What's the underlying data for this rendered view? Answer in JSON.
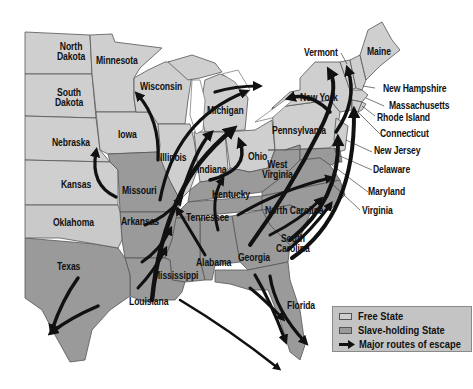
{
  "colors": {
    "free_state": "#cfcfcf",
    "slave_state": "#9a9a9a",
    "border": "#555555",
    "route": "#111111",
    "water": "#ffffff",
    "legend_bg": "#c4c4c4"
  },
  "states": {
    "north_dakota": "North\nDakota",
    "minnesota": "Minnesota",
    "south_dakota": "South\nDakota",
    "wisconsin": "Wisconsin",
    "michigan": "Michigan",
    "iowa": "Iowa",
    "nebraska": "Nebraska",
    "illinois": "Illinois",
    "indiana": "Indiana",
    "ohio": "Ohio",
    "kansas": "Kansas",
    "missouri": "Missouri",
    "kentucky": "Kentucky",
    "west_virginia": "West\nVirginia",
    "pennsylvania": "Pennsylvania",
    "new_york": "New York",
    "oklahoma": "Oklahoma",
    "arkansas": "Arkansas",
    "tennessee": "Tennessee",
    "north_carolina": "North Carolina",
    "south_carolina": "South\nCarolina",
    "texas": "Texas",
    "mississippi": "Mississippi",
    "alabama": "Alabama",
    "georgia": "Georgia",
    "louisiana": "Louisiana",
    "florida": "Florida",
    "vermont": "Vermont",
    "maine": "Maine",
    "new_hampshire": "New Hampshire",
    "massachusetts": "Massachusetts",
    "rhode_island": "Rhode Island",
    "connecticut": "Connecticut",
    "new_jersey": "New Jersey",
    "delaware": "Delaware",
    "maryland": "Maryland",
    "virginia": "Virginia"
  },
  "legend": {
    "free_state": "Free State",
    "slave_state": "Slave-holding State",
    "routes": "Major routes of escape"
  }
}
